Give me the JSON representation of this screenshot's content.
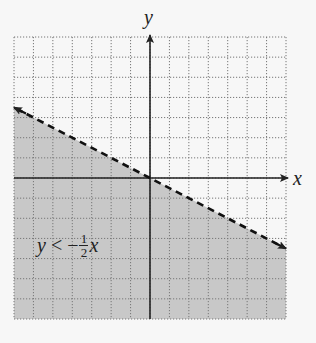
{
  "chart_data": {
    "type": "inequality-graph",
    "title": "",
    "xlabel": "x",
    "ylabel": "y",
    "xlim": [
      -7,
      7
    ],
    "ylim": [
      -7,
      7
    ],
    "grid": true,
    "grid_style": "dotted",
    "boundary_line": {
      "equation": "y = -1/2 x",
      "slope": -0.5,
      "intercept": 0,
      "style": "dashed",
      "arrows": "both"
    },
    "shaded_region": "below",
    "annotation": {
      "text": "y < -1/2 x",
      "parts": {
        "lhs": "y",
        "op": "<",
        "neg": "−",
        "num": "1",
        "den": "2",
        "var": "x"
      }
    },
    "colors": {
      "shade": "#c8c8c8",
      "grid": "#777777",
      "axis": "#222222",
      "line": "#111111",
      "background": "#f7f7f7"
    }
  }
}
